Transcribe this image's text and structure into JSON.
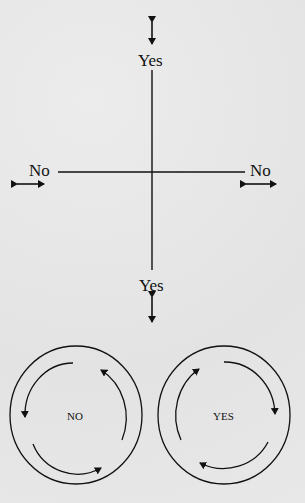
{
  "diagram": {
    "axes": {
      "top_label": "Yes",
      "bottom_label": "Yes",
      "left_label": "No",
      "right_label": "No"
    },
    "cycles": [
      {
        "label": "NO",
        "direction": "counterclockwise"
      },
      {
        "label": "YES",
        "direction": "clockwise"
      }
    ],
    "colors": {
      "ink": "#111111",
      "paper": "#e6e6e6"
    }
  }
}
